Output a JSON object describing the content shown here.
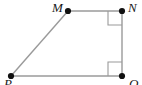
{
  "figure": {
    "kind": "geometry-diagram",
    "shape_name": "quadrilateral MNQP",
    "background_color": "#ffffff",
    "edge_color": "#9a9a9a",
    "vertex_dot_color": "#111111",
    "label_color": "#1a1a1a",
    "right_angle_marker_color": "#9a9a9a",
    "viewbox": {
      "width": 142,
      "height": 85
    },
    "vertices": [
      {
        "id": "M",
        "label": "M",
        "x": 68,
        "y": 11,
        "label_x": 52,
        "label_y": 1,
        "dot": true
      },
      {
        "id": "N",
        "label": "N",
        "x": 122,
        "y": 11,
        "label_x": 128,
        "label_y": 1,
        "dot": true
      },
      {
        "id": "Q",
        "label": "Q",
        "x": 122,
        "y": 76,
        "label_x": 129,
        "label_y": 77,
        "dot": true
      },
      {
        "id": "P",
        "label": "P",
        "x": 11,
        "y": 76,
        "label_x": 4,
        "label_y": 77,
        "dot": true
      }
    ],
    "edges": [
      {
        "id": "MN",
        "from": "M",
        "to": "N"
      },
      {
        "id": "NQ",
        "from": "N",
        "to": "Q"
      },
      {
        "id": "QP",
        "from": "Q",
        "to": "P"
      },
      {
        "id": "PM",
        "from": "P",
        "to": "M"
      }
    ],
    "right_angles": [
      {
        "id": "angle-N",
        "at": "N",
        "size": 14,
        "corner_x": 108,
        "corner_y": 25
      },
      {
        "id": "angle-Q",
        "at": "Q",
        "size": 14,
        "corner_x": 108,
        "corner_y": 62
      }
    ]
  }
}
